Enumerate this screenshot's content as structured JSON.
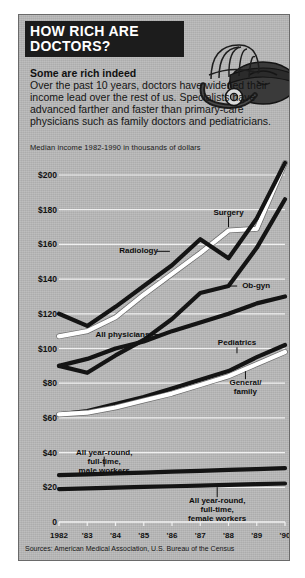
{
  "headline": {
    "line1": "HOW RICH ARE",
    "line2": "DOCTORS?"
  },
  "deck": "Some are rich indeed",
  "body": "Over the past 10 years, doctors have widened their income lead over the rest of us.  Specialists have advanced farther and faster than primary-care physicians such as family doctors and pediatricians.",
  "art": {
    "name": "doctor-bag-stethoscope-illustration"
  },
  "source": "Sources: American Medical Association, U.S. Bureau of the Census",
  "chart_data": {
    "type": "line",
    "title": "HOW RICH ARE DOCTORS?",
    "subtitle": "Median income 1982-1990 in thousands of dollars",
    "xlabel": "",
    "ylabel": "",
    "grid": true,
    "legend": "inline-annotations",
    "x": [
      1982,
      1983,
      1984,
      1985,
      1986,
      1987,
      1988,
      1989,
      1990
    ],
    "categories": [
      "1982",
      "'83",
      "'84",
      "'85",
      "'86",
      "'87",
      "'88",
      "'89",
      "'90"
    ],
    "ylim": [
      0,
      200
    ],
    "yticks": [
      0,
      20,
      40,
      60,
      80,
      100,
      120,
      140,
      160,
      180,
      200
    ],
    "ytick_labels": [
      "0",
      "$20",
      "$40",
      "$60",
      "$80",
      "$100",
      "$120",
      "$140",
      "$160",
      "$180",
      "$200"
    ],
    "series": [
      {
        "name": "Surgery",
        "color": "#ffffff",
        "style": "white-line",
        "values": [
          107,
          110,
          118,
          131,
          143,
          155,
          168,
          169,
          207
        ]
      },
      {
        "name": "Radiology",
        "color": "#141414",
        "style": "black-line",
        "values": [
          120,
          113,
          124,
          136,
          148,
          163,
          152,
          175,
          207
        ]
      },
      {
        "name": "Ob-gyn",
        "color": "#141414",
        "style": "black-line",
        "values": [
          90,
          86,
          96,
          105,
          117,
          132,
          136,
          158,
          186
        ]
      },
      {
        "name": "All physicians",
        "color": "#141414",
        "style": "black-line",
        "values": [
          90,
          94,
          100,
          104,
          110,
          115,
          120,
          126,
          130
        ]
      },
      {
        "name": "Pediatrics",
        "color": "#141414",
        "style": "black-line",
        "values": [
          62,
          64,
          68,
          72,
          77,
          82,
          87,
          95,
          102
        ]
      },
      {
        "name": "General/family",
        "color": "#ffffff",
        "style": "white-line",
        "values": [
          62,
          63,
          66,
          70,
          74,
          79,
          84,
          91,
          98
        ]
      },
      {
        "name": "All year-round, full-time, male workers",
        "color": "#141414",
        "style": "black-line",
        "values": [
          27,
          27.5,
          28,
          28.5,
          29,
          29.5,
          30,
          30.5,
          31
        ]
      },
      {
        "name": "All year-round, full-time, female workers",
        "color": "#141414",
        "style": "black-line",
        "values": [
          19,
          19.4,
          19.8,
          20.2,
          20.6,
          21,
          21.4,
          21.8,
          22.2
        ]
      }
    ],
    "annotations": [
      {
        "label": "Surgery",
        "x": 1988,
        "y": 178
      },
      {
        "label": "Radiology",
        "x": 1985.5,
        "y": 156
      },
      {
        "label": "Ob-gyn",
        "x": 1988.2,
        "y": 136
      },
      {
        "label": "All physicians",
        "x": 1985.2,
        "y": 108
      },
      {
        "label": "Pediatrics",
        "x": 1988.3,
        "y": 103
      },
      {
        "label": "General/family",
        "x": 1988.6,
        "y": 80
      },
      {
        "label": "All year-round, full-time, male workers",
        "x": 1983.6,
        "y": 40
      },
      {
        "label": "All year-round, full-time, female workers",
        "x": 1987.6,
        "y": 12
      }
    ]
  }
}
